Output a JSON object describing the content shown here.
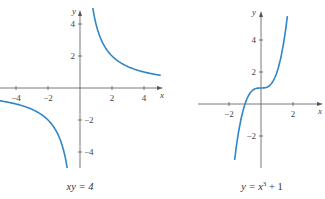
{
  "chart_data": [
    {
      "type": "line",
      "title": "xy = 4",
      "caption": "xy = 4",
      "xlabel": "x",
      "ylabel": "y",
      "xlim": [
        -5,
        5
      ],
      "ylim": [
        -5,
        5
      ],
      "x_ticks": [
        -4,
        -2,
        2,
        4
      ],
      "y_ticks": [
        4,
        2,
        -2,
        -4
      ],
      "x_tick_labels": [
        "−4",
        "−2",
        "2",
        "4"
      ],
      "y_tick_labels": [
        "4",
        "2",
        "−2",
        "−4"
      ],
      "grid": false,
      "series": [
        {
          "name": "y = 4/x (x>0)",
          "x": [
            0.8,
            1,
            1.5,
            2,
            3,
            4,
            5
          ],
          "y": [
            5,
            4,
            2.67,
            2,
            1.33,
            1,
            0.8
          ]
        },
        {
          "name": "y = 4/x (x<0)",
          "x": [
            -5,
            -4,
            -3,
            -2,
            -1.5,
            -1,
            -0.8
          ],
          "y": [
            -0.8,
            -1,
            -1.33,
            -2,
            -2.67,
            -4,
            -5
          ]
        }
      ],
      "color": "#2e86c8"
    },
    {
      "type": "line",
      "title": "y = x³ + 1",
      "caption": "y = x³ + 1",
      "xlabel": "x",
      "ylabel": "y",
      "xlim": [
        -3.5,
        3.8
      ],
      "ylim": [
        -4,
        5.5
      ],
      "x_ticks": [
        -2,
        2
      ],
      "y_ticks": [
        4,
        2,
        -2
      ],
      "x_tick_labels": [
        "−2",
        "2"
      ],
      "y_tick_labels": [
        "4",
        "2",
        "−2"
      ],
      "grid": false,
      "series": [
        {
          "name": "y = x^3 + 1",
          "x": [
            -1.6,
            -1.2,
            -1,
            -0.5,
            0,
            0.5,
            1,
            1.2,
            1.6
          ],
          "y": [
            -3.1,
            -0.73,
            0,
            0.875,
            1,
            1.125,
            2,
            2.73,
            5.1
          ]
        }
      ],
      "color": "#2e86c8"
    }
  ],
  "left": {
    "caption_main": "xy = 4",
    "x_label": "x",
    "y_label": "y",
    "ticks": {
      "xm4": "−4",
      "xm2": "−2",
      "x2": "2",
      "x4": "4",
      "y4": "4",
      "y2": "2",
      "ym2": "−2",
      "ym4": "−4"
    }
  },
  "right": {
    "caption_pre": "y = x",
    "caption_sup": "3",
    "caption_post": " + 1",
    "x_label": "x",
    "y_label": "y",
    "ticks": {
      "xm2": "−2",
      "x2": "2",
      "y4": "4",
      "y2": "2",
      "ym2": "−2"
    }
  }
}
